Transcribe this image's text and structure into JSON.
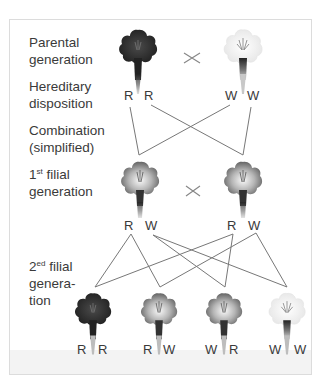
{
  "labels": {
    "parental": [
      "Parental",
      "generation"
    ],
    "hereditary": [
      "Hereditary",
      "disposition"
    ],
    "combination": [
      "Combination",
      "(simplified)"
    ],
    "f1": {
      "num": "1",
      "sup": "st",
      "rest": " filial",
      "line2": "generation"
    },
    "f2": {
      "num": "2",
      "sup": "ed",
      "rest": " filial",
      "line2": "genera-",
      "line3": "tion"
    }
  },
  "cross_symbol": "×",
  "parents": [
    {
      "color": "red",
      "alleles": [
        "R",
        "R"
      ]
    },
    {
      "color": "white",
      "alleles": [
        "W",
        "W"
      ]
    }
  ],
  "f1": [
    {
      "color": "pink",
      "alleles": [
        "R",
        "W"
      ]
    },
    {
      "color": "pink",
      "alleles": [
        "R",
        "W"
      ]
    }
  ],
  "f2": [
    {
      "color": "red",
      "alleles": [
        "R",
        "R"
      ]
    },
    {
      "color": "pink",
      "alleles": [
        "R",
        "W"
      ]
    },
    {
      "color": "pink",
      "alleles": [
        "W",
        "R"
      ]
    },
    {
      "color": "white",
      "alleles": [
        "W",
        "W"
      ]
    }
  ],
  "colors": {
    "red_petal": "#2a2a2a",
    "pink_petal": "#8a8a8a",
    "white_petal": "#f2f2f2",
    "line": "#777777",
    "frame_border": "#dcdcdc"
  }
}
